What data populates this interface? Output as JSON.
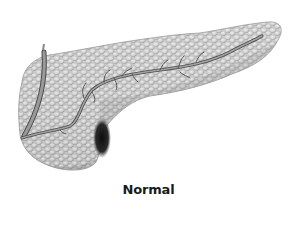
{
  "figure": {
    "caption": "Normal",
    "structures": [
      {
        "name": "pancreas-body",
        "description": "lobulated glandular tissue, head at left, tail at right"
      },
      {
        "name": "main-pancreatic-duct",
        "description": "duct running from tail to head with small side branches"
      },
      {
        "name": "common-bile-duct",
        "description": "duct entering from top-left and joining near the head"
      }
    ],
    "colors": {
      "background": "#ffffff",
      "tissue_light": "#e6e6e6",
      "tissue_mid": "#b8b8b8",
      "tissue_dark": "#6e6e6e",
      "shadow": "#1e1e1e",
      "duct": "#8a8a8a",
      "duct_edge": "#4a4a4a",
      "caption": "#1a1a1a"
    }
  }
}
